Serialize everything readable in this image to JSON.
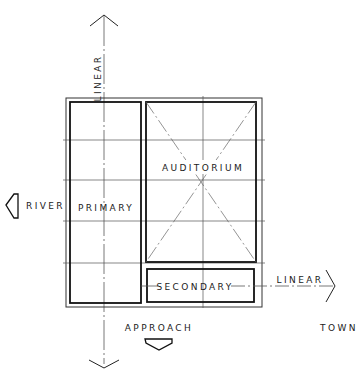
{
  "diagram": {
    "type": "architectural-concept-sketch",
    "colors": {
      "ink": "#1a1a1a",
      "grid": "#6a6a6a",
      "background": "#ffffff"
    },
    "axes": {
      "vertical": {
        "label": "LINEAR",
        "arrow_top": "arrow-up",
        "arrow_bottom": "arrow-down"
      },
      "horizontal": {
        "label": "LINEAR",
        "arrow_right": "arrow-right"
      }
    },
    "blocks": [
      {
        "id": "primary",
        "label": "PRIMARY"
      },
      {
        "id": "auditorium",
        "label": "AUDITORIUM"
      },
      {
        "id": "secondary",
        "label": "SECONDARY"
      }
    ],
    "context": {
      "river": {
        "label": "RIVER",
        "icon": "river-arrow-left-icon"
      },
      "approach": {
        "label": "APPROACH",
        "icon": "approach-arrow-down-icon"
      },
      "town": {
        "label": "TOWN"
      }
    }
  }
}
